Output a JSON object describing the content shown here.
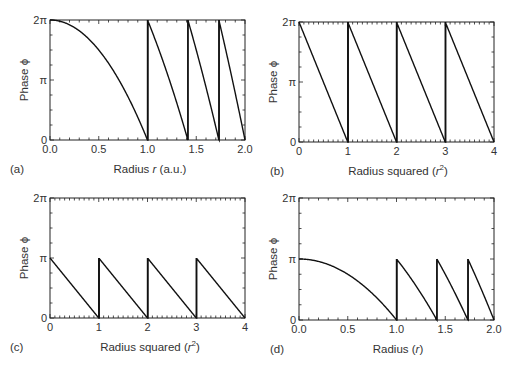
{
  "chart_data": [
    {
      "id": "a",
      "type": "line",
      "panel_label": "(a)",
      "title": "",
      "xlabel": "Radius r (a.u.)",
      "ylabel": "Phase ϕ",
      "xlim": [
        0,
        2
      ],
      "ylim_label": [
        "0",
        "2π"
      ],
      "x_ticks": [
        "0.0",
        "0.5",
        "1.0",
        "1.5",
        "2.0"
      ],
      "y_ticks": [
        "0",
        "π",
        "2π"
      ],
      "description": "Quadratic phase 2π(1 - r^2) wrapped modulo 2π; jumps at r = 1, √2, √3, 2",
      "wrap_points": [
        1.0,
        1.414,
        1.732,
        2.0
      ],
      "max_phase_pi": 2
    },
    {
      "id": "b",
      "type": "line",
      "panel_label": "(b)",
      "xlabel": "Radius squared (r²)",
      "ylabel": "Phase ϕ",
      "xlim": [
        0,
        4
      ],
      "x_ticks": [
        "0",
        "1",
        "2",
        "3",
        "4"
      ],
      "y_ticks": [
        "0",
        "π",
        "2π"
      ],
      "description": "Sawtooth from 2π to 0 per unit of r²",
      "wrap_points": [
        1,
        2,
        3,
        4
      ],
      "max_phase_pi": 2
    },
    {
      "id": "c",
      "type": "line",
      "panel_label": "(c)",
      "xlabel": "Radius squared (r²)",
      "ylabel": "Phase ϕ",
      "xlim": [
        0,
        4
      ],
      "x_ticks": [
        "0",
        "1",
        "2",
        "3",
        "4"
      ],
      "y_ticks": [
        "0",
        "π",
        "2π"
      ],
      "description": "Sawtooth from π to 0 per unit of r²",
      "wrap_points": [
        1,
        2,
        3,
        4
      ],
      "max_phase_pi": 1
    },
    {
      "id": "d",
      "type": "line",
      "panel_label": "(d)",
      "xlabel": "Radius (r)",
      "ylabel": "Phase ϕ",
      "xlim": [
        0,
        2
      ],
      "x_ticks": [
        "0.0",
        "0.5",
        "1.0",
        "1.5",
        "2.0"
      ],
      "y_ticks": [
        "0",
        "π",
        "2π"
      ],
      "description": "Quadratic phase π(1 - r^2) wrapped modulo π; jumps at r = 1, √2, √3, 2",
      "wrap_points": [
        1.0,
        1.414,
        1.732,
        2.0
      ],
      "max_phase_pi": 1
    }
  ],
  "panels": [
    {
      "tag": "(a)",
      "xlabel_pre": "Radius ",
      "xlabel_var": "r",
      "xlabel_post": " (a.u.)",
      "ylabel": "Phase ϕ"
    },
    {
      "tag": "(b)",
      "xlabel_pre": "Radius squared (",
      "xlabel_var": "r",
      "xlabel_sup": "2",
      "xlabel_post": ")",
      "ylabel": "Phase ϕ"
    },
    {
      "tag": "(c)",
      "xlabel_pre": "Radius squared (",
      "xlabel_var": "r",
      "xlabel_sup": "2",
      "xlabel_post": ")",
      "ylabel": "Phase ϕ"
    },
    {
      "tag": "(d)",
      "xlabel_pre": "Radius  (",
      "xlabel_var": "r",
      "xlabel_post": ")",
      "ylabel": "Phase ϕ"
    }
  ]
}
